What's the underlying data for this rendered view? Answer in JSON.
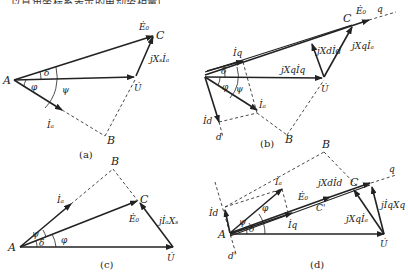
{
  "header_fragment": "…以直角坐标系表示的电动势相量图…",
  "diagrams": {
    "a": {
      "caption": "(a)",
      "labels": {
        "A": "A",
        "B": "B",
        "C": "C",
        "E0": "Ė₀",
        "U": "U̇",
        "Ia": "İₐ",
        "jXsIa": "jXₛİₐ",
        "delta": "δ",
        "phi": "φ",
        "psi": "ψ"
      }
    },
    "b": {
      "caption": "(b)",
      "labels": {
        "B": "B",
        "C": "C",
        "E0": "Ė₀",
        "q": "q",
        "d": "d",
        "U": "U̇",
        "Iq": "İq",
        "Id": "İd",
        "Ia": "İₐ",
        "jXqIq": "jXqİq",
        "jXdId": "jXdİd",
        "jXqIa": "jXqİₐ",
        "delta": "δ",
        "phi": "φ",
        "psi": "ψ"
      }
    },
    "c": {
      "caption": "(c)",
      "labels": {
        "A": "A",
        "B": "B",
        "C": "C",
        "E0": "Ė₀",
        "U": "U̇",
        "Ia": "İₐ",
        "jIaXs": "jİₐXₛ",
        "delta": "δ",
        "phi": "φ",
        "psi": "ψ"
      }
    },
    "d": {
      "caption": "(d)",
      "labels": {
        "A": "A",
        "B": "B",
        "C": "C",
        "Cp": "C'",
        "E0": "Ė₀",
        "q": "q",
        "d_top": "d",
        "d_bot": "d'",
        "U": "U̇",
        "Ia": "İₐ",
        "Id": "İd",
        "Iq": "İq",
        "jXdId": "jXdİd",
        "jXqIa": "jXqİₐ",
        "jIqXq": "jİqXq",
        "delta": "δ",
        "phi": "φ",
        "psi": "ψ"
      }
    }
  }
}
